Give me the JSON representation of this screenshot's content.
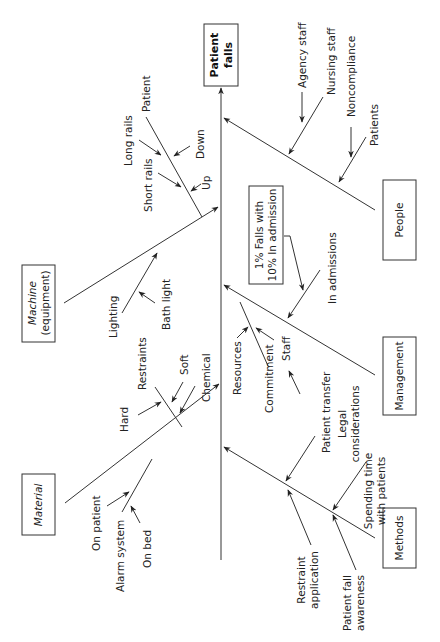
{
  "effect": {
    "line1": "Patient",
    "line2": "falls"
  },
  "categories": {
    "people": {
      "label": "People",
      "causes": [
        "Agency staff",
        "Nursing staff",
        "Noncompliance",
        "Patients"
      ]
    },
    "management": {
      "label": "Management",
      "note_line1": "1% Falls with",
      "note_line2": "10% In admission",
      "causes": [
        "In admissions",
        "Resources",
        "Commitment",
        "Staff"
      ]
    },
    "methods": {
      "label": "Methods",
      "causes": [
        "Patient transfer",
        "Legal",
        "considerations",
        "Spending time",
        "with patients",
        "Restraint",
        "application",
        "Patient fall",
        "awareness"
      ]
    },
    "machine": {
      "label_line1": "Machine",
      "label_line2": "(equipment)",
      "causes": [
        "Long rails",
        "Patient",
        "Down",
        "Short rails",
        "Up",
        "Lighting",
        "Bath light"
      ]
    },
    "material": {
      "label": "Material",
      "causes": [
        "Restraints",
        "Hard",
        "Soft",
        "Chemical",
        "On patient",
        "Alarm system",
        "On bed"
      ]
    }
  },
  "colors": {
    "line": "#333333",
    "text": "#222222",
    "background": "#ffffff"
  }
}
